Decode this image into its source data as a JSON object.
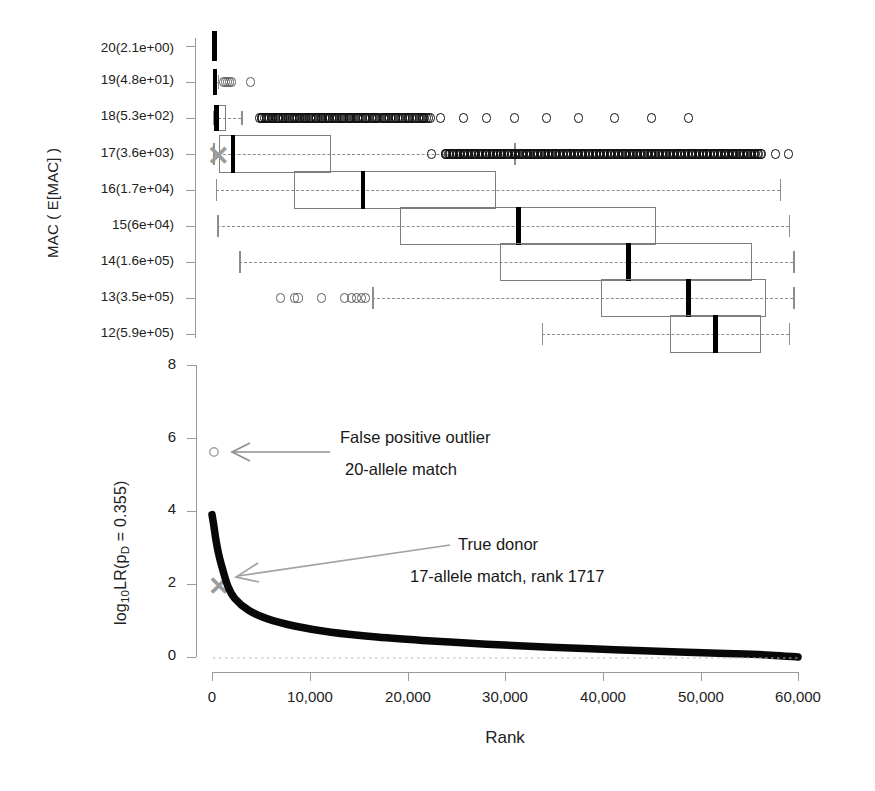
{
  "figure": {
    "width": 875,
    "height": 791,
    "background": "#ffffff"
  },
  "panel_top": {
    "name": "boxplot-panel",
    "y_axis_title": "MAC ( E[MAC] )",
    "y_tick_labels": [
      "20(2.1e+00)",
      "19(4.8e+01)",
      "18(5.3e+02)",
      "17(3.6e+03)",
      "16(1.7e+04)",
      "15(6e+04)",
      "14(1.6e+05)",
      "13(3.5e+05)",
      "12(5.9e+05)"
    ],
    "marker_label": "true-donor-x-marker",
    "marker_color": "#9b9b9b"
  },
  "panel_bottom": {
    "name": "rank-decay-panel",
    "y_axis_title": "log10LR(pD = 0.355)",
    "y_axis_title_parts": {
      "log": "log",
      "base": "10",
      "lr": "LR(p",
      "d": "D",
      "eq": " = 0.355)"
    },
    "y_tick_labels": [
      "8",
      "6",
      "4",
      "2",
      "0"
    ],
    "y_ticks": [
      8,
      6,
      4,
      2,
      0
    ],
    "x_axis_title": "Rank",
    "x_tick_labels": [
      "0",
      "10,000",
      "20,000",
      "30,000",
      "40,000",
      "50,000",
      "60,000"
    ],
    "x_ticks": [
      0,
      10000,
      20000,
      30000,
      40000,
      50000,
      60000
    ],
    "annotations": [
      {
        "name": "false-positive-annotation",
        "line1": "False positive outlier",
        "line2": "20-allele match"
      },
      {
        "name": "true-donor-annotation",
        "line1": "True donor",
        "line2": "17-allele match, rank 1717"
      }
    ]
  },
  "chart_data": [
    {
      "type": "boxplot",
      "name": "mac-rank-boxplots",
      "title": "",
      "xlabel": "",
      "ylabel": "MAC ( E[MAC] )",
      "orientation": "horizontal",
      "xlim": [
        0,
        64000
      ],
      "grid": false,
      "categories": [
        "20(2.1e+00)",
        "19(4.8e+01)",
        "18(5.3e+02)",
        "17(3.6e+03)",
        "16(1.7e+04)",
        "15(6e+04)",
        "14(1.6e+05)",
        "13(3.5e+05)",
        "12(5.9e+05)"
      ],
      "boxes": [
        {
          "category": "20(2.1e+00)",
          "whisker_low": 150,
          "q1": 200,
          "median": 260,
          "q3": 330,
          "whisker_high": 400,
          "outliers": []
        },
        {
          "category": "19(4.8e+01)",
          "whisker_low": 120,
          "q1": 200,
          "median": 320,
          "q3": 450,
          "whisker_high": 620,
          "outliers": [
            1300,
            1500,
            1700,
            1900,
            2100,
            4200
          ]
        },
        {
          "category": "18(5.3e+02)",
          "whisker_low": 100,
          "q1": 300,
          "median": 500,
          "q3": 1500,
          "whisker_high": 3200,
          "outliers": [
            5400,
            6000,
            6600,
            7200,
            7800,
            8400,
            9000,
            9600,
            10200,
            10800,
            11400,
            12000,
            12700,
            13400,
            14200,
            15000,
            15900,
            16800,
            17800,
            18900,
            20000,
            21500,
            23000,
            25000,
            27500,
            30000,
            33000,
            36500,
            40000,
            44000,
            48000,
            52000
          ]
        },
        {
          "category": "17(3.6e+03)",
          "whisker_low": 150,
          "q1": 800,
          "median": 2300,
          "q3": 13000,
          "whisker_high": 33000,
          "outliers": [
            24000,
            25500,
            27000,
            28500,
            30000,
            31500,
            33000,
            34500,
            36000,
            37500,
            39000,
            40500,
            42000,
            43500,
            45000,
            46500,
            48000,
            49500,
            51000,
            52500,
            54000,
            55500,
            57000,
            58500,
            60000,
            61500,
            63000
          ]
        },
        {
          "category": "16(1.7e+04)",
          "whisker_low": 400,
          "q1": 9000,
          "median": 16500,
          "q3": 31000,
          "whisker_high": 62000,
          "outliers": []
        },
        {
          "category": "15(6e+04)",
          "whisker_low": 600,
          "q1": 20500,
          "median": 33500,
          "q3": 48500,
          "whisker_high": 63000,
          "outliers": []
        },
        {
          "category": "14(1.6e+05)",
          "whisker_low": 3000,
          "q1": 31500,
          "median": 45500,
          "q3": 59000,
          "whisker_high": 63500,
          "outliers": []
        },
        {
          "category": "13(3.5e+05)",
          "whisker_low": 17500,
          "q1": 42500,
          "median": 52000,
          "q3": 60500,
          "whisker_high": 63500,
          "outliers": [
            7500,
            9000,
            9400,
            12000,
            14500,
            15200,
            15800,
            16300,
            16800
          ]
        },
        {
          "category": "12(5.9e+05)",
          "whisker_low": 36000,
          "q1": 50000,
          "median": 55000,
          "q3": 60000,
          "whisker_high": 63000,
          "outliers": []
        }
      ]
    },
    {
      "type": "line",
      "name": "lr-rank-decay",
      "title": "",
      "xlabel": "Rank",
      "ylabel": "log10LR(pD = 0.355)",
      "xlim": [
        0,
        64000
      ],
      "ylim": [
        0,
        8
      ],
      "grid": false,
      "legend": "none",
      "series": [
        {
          "name": "sorted log10 LR by rank",
          "x": [
            0,
            200,
            400,
            700,
            1000,
            1717,
            2500,
            4000,
            6000,
            9000,
            13000,
            18000,
            24000,
            30000,
            37000,
            44000,
            51000,
            57000,
            61000,
            64000
          ],
          "y": [
            3.9,
            3.6,
            3.25,
            2.85,
            2.55,
            1.95,
            1.6,
            1.28,
            1.05,
            0.85,
            0.68,
            0.55,
            0.44,
            0.35,
            0.27,
            0.2,
            0.14,
            0.09,
            0.05,
            0.0
          ]
        }
      ],
      "points": [
        {
          "name": "false-positive-outlier",
          "x": 400,
          "y": 5.52,
          "marker": "circle",
          "color": "#9a9a9a",
          "label": "False positive outlier / 20-allele match"
        },
        {
          "name": "true-donor",
          "x": 1717,
          "y": 1.92,
          "marker": "x",
          "color": "#9b9b9b",
          "label": "True donor / 17-allele match, rank 1717"
        }
      ]
    }
  ]
}
